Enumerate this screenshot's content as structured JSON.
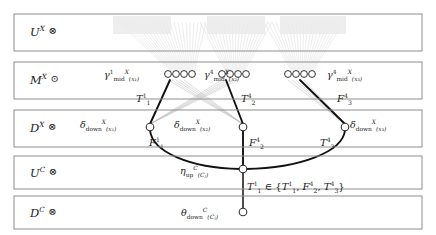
{
  "diagram": {
    "colors": {
      "box_border": "#8e8e8e",
      "edge_bold": "#111111",
      "edge_faint": "#c9c9c9",
      "node_fill": "#ffffff",
      "node_stroke": "#333333",
      "text": "#1a1a1a",
      "background": "#ffffff"
    },
    "rows": [
      {
        "id": "row-ux",
        "label_base": "U",
        "label_sup": "X",
        "operator": "⊗",
        "operator_name": "tensor-icon",
        "y": 14,
        "height": 37
      },
      {
        "id": "row-mx",
        "label_base": "M",
        "label_sup": "X",
        "operator": "⊙",
        "operator_name": "odot-icon",
        "y": 62,
        "height": 37
      },
      {
        "id": "row-dx",
        "label_base": "D",
        "label_sup": "X",
        "operator": "⊗",
        "operator_name": "tensor-icon",
        "y": 110,
        "height": 37
      },
      {
        "id": "row-uc",
        "label_base": "U",
        "label_sup": "C",
        "operator": "⊗",
        "operator_name": "tensor-icon",
        "y": 156,
        "height": 33
      },
      {
        "id": "row-dc",
        "label_base": "D",
        "label_sup": "C",
        "operator": "⊗",
        "operator_name": "tensor-icon",
        "y": 196,
        "height": 33
      }
    ],
    "clusters": [
      {
        "id": "cluster-x1",
        "gamma_sup": "1",
        "gamma_name": "mid",
        "gamma_space": "X",
        "arg": "x₁",
        "node_count": 4,
        "cx": 175,
        "cy": 76
      },
      {
        "id": "cluster-x2",
        "gamma_sup": "4",
        "gamma_name": "mid",
        "gamma_space": "X",
        "arg": "x₂",
        "node_count": 4,
        "cx": 232,
        "cy": 76
      },
      {
        "id": "cluster-x3",
        "gamma_sup": "4",
        "gamma_name": "mid",
        "gamma_space": "X",
        "arg": "x₃",
        "node_count": 4,
        "cx": 300,
        "cy": 76
      }
    ],
    "cluster_labels": [
      {
        "id": "gamma-label-1",
        "text": "γ",
        "sup": "1",
        "sub": "mid",
        "space": "X",
        "arg": "(x₁)",
        "x": 104,
        "y": 70
      },
      {
        "id": "gamma-label-2",
        "text": "γ",
        "sup": "4",
        "sub": "mid",
        "space": "X",
        "arg": "(x₂)",
        "x": 204,
        "y": 70
      },
      {
        "id": "gamma-label-3",
        "text": "γ",
        "sup": "4",
        "sub": "mid",
        "space": "X",
        "arg": "(x₃)",
        "x": 327,
        "y": 70
      }
    ],
    "delta_labels": [
      {
        "id": "delta-label-1",
        "text": "δ",
        "sub": "down",
        "space": "X",
        "arg": "(x₁)",
        "x": 80,
        "y": 120
      },
      {
        "id": "delta-label-2",
        "text": "δ",
        "sub": "down",
        "space": "X",
        "arg": "(x₂)",
        "x": 174,
        "y": 120
      },
      {
        "id": "delta-label-3",
        "text": "δ",
        "sub": "down",
        "space": "X",
        "arg": "(x₃)",
        "x": 350,
        "y": 120
      }
    ],
    "dx_nodes": [
      {
        "id": "dx-node-1",
        "cx": 150,
        "cy": 127
      },
      {
        "id": "dx-node-2",
        "cx": 243,
        "cy": 127
      },
      {
        "id": "dx-node-3",
        "cx": 345,
        "cy": 127
      }
    ],
    "uc_node": {
      "id": "uc-node",
      "cx": 243,
      "cy": 169,
      "label": "η",
      "sub": "up",
      "space": "C",
      "arg": "(Cⱼ)",
      "label_x": 180,
      "label_y": 166
    },
    "dc_node": {
      "id": "dc-node",
      "cx": 243,
      "cy": 212,
      "label": "θ",
      "sub": "down",
      "space": "C",
      "arg": "(Cⱼ)",
      "label_x": 181,
      "label_y": 208
    },
    "upper_edge_labels": [
      {
        "id": "edge-label-t11",
        "base": "T",
        "sup": "1",
        "sub": "1",
        "x": 136,
        "y": 95
      },
      {
        "id": "edge-label-t24",
        "base": "T",
        "sup": "4",
        "sub": "2",
        "x": 241,
        "y": 95
      },
      {
        "id": "edge-label-f34",
        "base": "F",
        "sup": "4",
        "sub": "3",
        "x": 337,
        "y": 95
      }
    ],
    "lower_edge_labels": [
      {
        "id": "edge-label-f11",
        "base": "F",
        "sup": "1",
        "sub": "1",
        "x": 149,
        "y": 139
      },
      {
        "id": "edge-label-f24",
        "base": "F",
        "sup": "4",
        "sub": "2",
        "x": 249,
        "y": 139
      },
      {
        "id": "edge-label-t34",
        "base": "T",
        "sup": "4",
        "sub": "3",
        "x": 320,
        "y": 139
      }
    ],
    "membership": {
      "id": "membership-label",
      "lhs_base": "T",
      "lhs_sup": "1",
      "lhs_sub": "1",
      "relation": "∈",
      "set_open": "{",
      "set_close": "}",
      "set_items": [
        {
          "base": "T",
          "sup": "1",
          "sub": "1"
        },
        {
          "base": "F",
          "sup": "4",
          "sub": "2"
        },
        {
          "base": "T",
          "sup": "4",
          "sub": "3"
        }
      ],
      "x": 247,
      "y": 183
    }
  }
}
